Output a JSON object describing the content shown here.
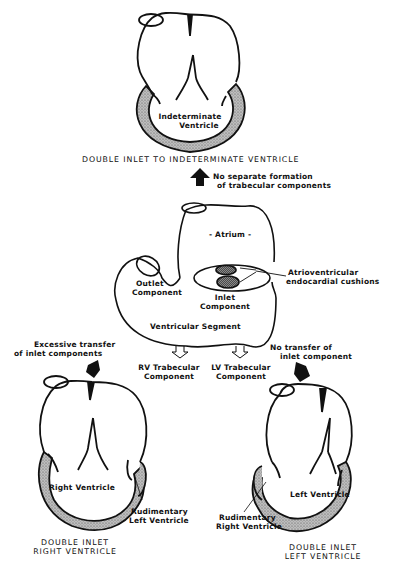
{
  "top": {
    "chamber_label_1": "Indeterminate",
    "chamber_label_2": "Ventricle",
    "title": "DOUBLE INLET TO INDETERMINATE VENTRICLE",
    "arrow_label_1": "No separate formation",
    "arrow_label_2": "of trabecular components"
  },
  "center": {
    "atrium_label": "- Atrium -",
    "outlet_label_1": "Outlet",
    "outlet_label_2": "Component",
    "inlet_label_1": "Inlet",
    "inlet_label_2": "Component",
    "segment_label": "Ventricular Segment",
    "cushion_label_1": "Atrioventricular",
    "cushion_label_2": "endocardial cushions",
    "rv_trab_1": "RV Trabecular",
    "rv_trab_2": "Component",
    "lv_trab_1": "LV Trabecular",
    "lv_trab_2": "Component"
  },
  "left": {
    "arrow_label_1": "Excessive transfer",
    "arrow_label_2": "of inlet components",
    "chamber_label": "Right Ventricle",
    "rudimentary_1": "Rudimentary",
    "rudimentary_2": "Left Ventricle",
    "title_1": "DOUBLE INLET",
    "title_2": "RIGHT VENTRICLE"
  },
  "right": {
    "arrow_label_1": "No transfer of",
    "arrow_label_2": "inlet component",
    "chamber_label": "Left Ventricle",
    "rudimentary_1": "Rudimentary",
    "rudimentary_2": "Right Ventricle",
    "title_1": "DOUBLE INLET",
    "title_2": "LEFT VENTRICLE"
  }
}
